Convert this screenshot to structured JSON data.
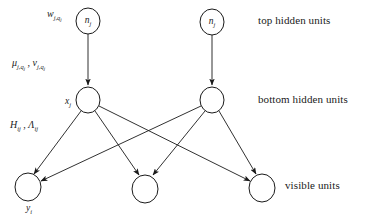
{
  "diagram": {
    "background_color": "#ffffff",
    "stroke_color": "#1a1a1a",
    "node_fill_color": "#ffffff",
    "layer_captions": [
      {
        "id": "top-hidden",
        "label": "top hidden units",
        "x": 258,
        "y": 21
      },
      {
        "id": "bottom-hidden",
        "label": "bottom hidden units",
        "x": 258,
        "y": 100
      },
      {
        "id": "visible",
        "label": "visible units",
        "x": 278,
        "y": 186
      }
    ],
    "edge_labels": [
      {
        "id": "weight-label",
        "text": "w",
        "sub": "j,q",
        "subsub": "j",
        "x": 47,
        "y": 13
      },
      {
        "id": "mu-nu-label",
        "text": "μ",
        "sub": "j,q",
        "subsub": "j",
        "text2": "ν",
        "sub2": "j,q",
        "subsub2": "j",
        "separator": " , ",
        "x": 12,
        "y": 60
      },
      {
        "id": "h-lambda-label",
        "text": "H",
        "sub": "ij",
        "text2": "Λ",
        "sub2": "ij",
        "separator": " , ",
        "x": 10,
        "y": 122
      }
    ],
    "nodes": [
      {
        "id": "top-hidden-left",
        "layer": "top-hidden",
        "label": "n",
        "sub": "j",
        "cx": 88,
        "cy": 21,
        "rx": 12,
        "ry": 13,
        "label_position": "inside"
      },
      {
        "id": "top-hidden-right",
        "layer": "top-hidden",
        "label": "n",
        "sub": "j",
        "cx": 212,
        "cy": 22,
        "rx": 12,
        "ry": 13,
        "label_position": "inside"
      },
      {
        "id": "bottom-hidden-left",
        "layer": "bottom-hidden",
        "label": "x",
        "sub": "j",
        "cx": 88,
        "cy": 100,
        "rx": 12,
        "ry": 13,
        "label_position": "left"
      },
      {
        "id": "bottom-hidden-right",
        "layer": "bottom-hidden",
        "label": "",
        "sub": "",
        "cx": 212,
        "cy": 100,
        "rx": 12,
        "ry": 13,
        "label_position": "none"
      },
      {
        "id": "visible-left",
        "layer": "visible",
        "label": "y",
        "sub": "i",
        "cx": 28,
        "cy": 187,
        "rx": 13,
        "ry": 14,
        "label_position": "below"
      },
      {
        "id": "visible-middle",
        "layer": "visible",
        "label": "",
        "sub": "",
        "cx": 145,
        "cy": 189,
        "rx": 13,
        "ry": 14,
        "label_position": "none"
      },
      {
        "id": "visible-right",
        "layer": "visible",
        "label": "",
        "sub": "",
        "cx": 262,
        "cy": 188,
        "rx": 13,
        "ry": 14,
        "label_position": "none"
      }
    ],
    "edges": [
      {
        "id": "edge-top-left-to-bottom-left",
        "from": "top-hidden-left",
        "to": "bottom-hidden-left",
        "arrow": true
      },
      {
        "id": "edge-top-right-to-bottom-right",
        "from": "top-hidden-right",
        "to": "bottom-hidden-right",
        "arrow": true
      },
      {
        "id": "edge-bottom-left-to-visible-left",
        "from": "bottom-hidden-left",
        "to": "visible-left",
        "arrow": true
      },
      {
        "id": "edge-bottom-left-to-visible-middle",
        "from": "bottom-hidden-left",
        "to": "visible-middle",
        "arrow": true
      },
      {
        "id": "edge-bottom-left-to-visible-right",
        "from": "bottom-hidden-left",
        "to": "visible-right",
        "arrow": true
      },
      {
        "id": "edge-bottom-right-to-visible-left",
        "from": "bottom-hidden-right",
        "to": "visible-left",
        "arrow": true
      },
      {
        "id": "edge-bottom-right-to-visible-middle",
        "from": "bottom-hidden-right",
        "to": "visible-middle",
        "arrow": true
      },
      {
        "id": "edge-bottom-right-to-visible-right",
        "from": "bottom-hidden-right",
        "to": "visible-right",
        "arrow": true
      }
    ]
  }
}
